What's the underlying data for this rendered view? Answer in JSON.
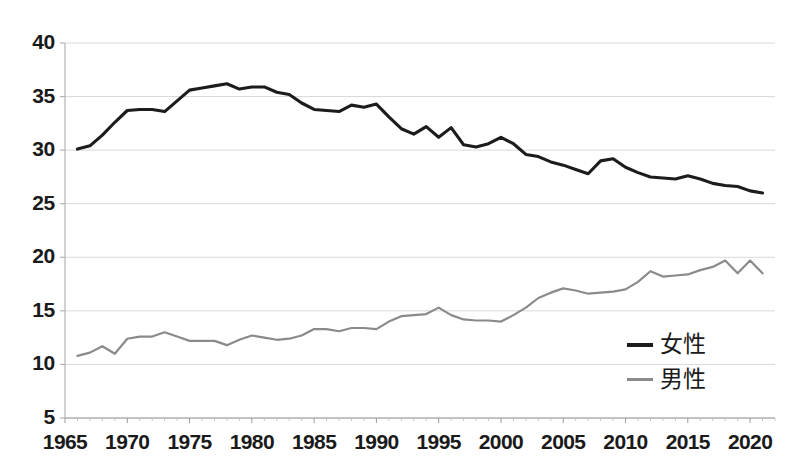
{
  "chart_data": {
    "type": "line",
    "title": "",
    "xlabel": "",
    "ylabel": "",
    "xlim": [
      1965,
      2022
    ],
    "ylim": [
      5,
      40
    ],
    "grid": true,
    "legend_position": "bottom-right",
    "y_ticks": [
      "40",
      "35",
      "30",
      "25",
      "20",
      "15",
      "10",
      "5"
    ],
    "y_tick_values": [
      40,
      35,
      30,
      25,
      20,
      15,
      10,
      5
    ],
    "x_ticks": [
      "1965",
      "1970",
      "1975",
      "1980",
      "1985",
      "1990",
      "1995",
      "2000",
      "2005",
      "2010",
      "2015",
      "2020"
    ],
    "x_tick_values": [
      1965,
      1970,
      1975,
      1980,
      1985,
      1990,
      1995,
      2000,
      2005,
      2010,
      2015,
      2020
    ],
    "x": [
      1966,
      1967,
      1968,
      1969,
      1970,
      1971,
      1972,
      1973,
      1974,
      1975,
      1976,
      1977,
      1978,
      1979,
      1980,
      1981,
      1982,
      1983,
      1984,
      1985,
      1986,
      1987,
      1988,
      1989,
      1990,
      1991,
      1992,
      1993,
      1994,
      1995,
      1996,
      1997,
      1998,
      1999,
      2000,
      2001,
      2002,
      2003,
      2004,
      2005,
      2006,
      2007,
      2008,
      2009,
      2010,
      2011,
      2012,
      2013,
      2014,
      2015,
      2016,
      2017,
      2018,
      2019,
      2020,
      2021
    ],
    "series": [
      {
        "name": "女性",
        "color": "#1c1c1c",
        "values": [
          30.1,
          30.4,
          31.4,
          32.6,
          33.7,
          33.8,
          33.8,
          33.6,
          34.6,
          35.6,
          35.8,
          36.0,
          36.2,
          35.7,
          35.9,
          35.9,
          35.4,
          35.2,
          34.4,
          33.8,
          33.7,
          33.6,
          34.2,
          34.0,
          34.3,
          33.1,
          32.0,
          31.5,
          32.2,
          31.2,
          32.1,
          30.5,
          30.3,
          30.6,
          31.2,
          30.6,
          29.6,
          29.4,
          28.9,
          28.6,
          28.2,
          27.8,
          29.0,
          29.2,
          28.4,
          27.9,
          27.5,
          27.4,
          27.3,
          27.6,
          27.3,
          26.9,
          26.7,
          26.6,
          26.2,
          26.0
        ]
      },
      {
        "name": "男性",
        "color": "#8a8a8a",
        "values": [
          10.8,
          11.1,
          11.7,
          11.0,
          12.4,
          12.6,
          12.6,
          13.0,
          12.6,
          12.2,
          12.2,
          12.2,
          11.8,
          12.3,
          12.7,
          12.5,
          12.3,
          12.4,
          12.7,
          13.3,
          13.3,
          13.1,
          13.4,
          13.4,
          13.3,
          14.0,
          14.5,
          14.6,
          14.7,
          15.3,
          14.6,
          14.2,
          14.1,
          14.1,
          14.0,
          14.6,
          15.3,
          16.2,
          16.7,
          17.1,
          16.9,
          16.6,
          16.7,
          16.8,
          17.0,
          17.7,
          18.7,
          18.2,
          18.3,
          18.4,
          18.8,
          19.1,
          19.7,
          18.5,
          19.7,
          18.5
        ]
      }
    ]
  },
  "legend": {
    "items": [
      {
        "label": "女性"
      },
      {
        "label": "男性"
      }
    ]
  },
  "colors": {
    "female_line": "#1c1c1c",
    "male_line": "#8a8a8a",
    "gridline": "#d9d9d9",
    "axis": "#b5b5b5",
    "text": "#1a1a1a",
    "background": "#ffffff"
  }
}
